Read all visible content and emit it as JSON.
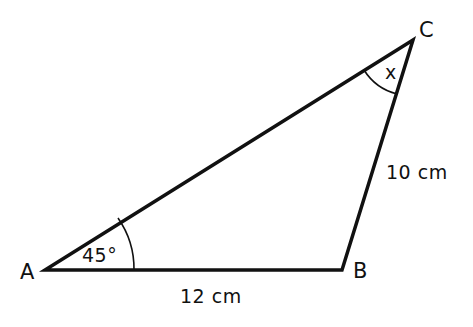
{
  "diagram": {
    "type": "triangle",
    "stroke_color": "#111111",
    "background": "#ffffff",
    "vertices": [
      {
        "name": "A",
        "x": 45,
        "y": 270
      },
      {
        "name": "B",
        "x": 342,
        "y": 270
      },
      {
        "name": "C",
        "x": 413,
        "y": 40
      }
    ],
    "sides": {
      "AB": "12 cm",
      "BC": "10 cm"
    },
    "angles": {
      "A": "45°",
      "C": "x"
    }
  }
}
